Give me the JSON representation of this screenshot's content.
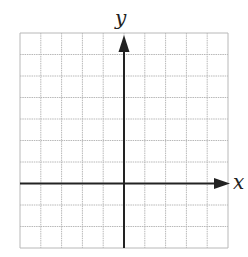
{
  "figure": {
    "type": "coordinate-grid",
    "x_axis_label": "x",
    "y_axis_label": "y",
    "grid": {
      "columns": 10,
      "rows": 10,
      "x_range": [
        -5,
        5
      ],
      "y_range": [
        -3,
        7
      ],
      "origin_column": 5,
      "origin_row_from_top": 7
    },
    "colors": {
      "grid_line": "#b8b8b8",
      "axis": "#222222",
      "background": "#ffffff"
    }
  }
}
